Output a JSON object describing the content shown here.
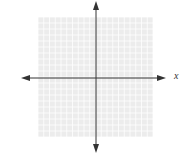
{
  "diagram": {
    "type": "coordinate-plane",
    "x_axis_label": "x",
    "y_axis_label": "",
    "grid": {
      "cells_x": 20,
      "cells_y": 20,
      "color": "#d8d8d8",
      "background": "#eeeeee"
    },
    "axis_color": "#333333"
  }
}
